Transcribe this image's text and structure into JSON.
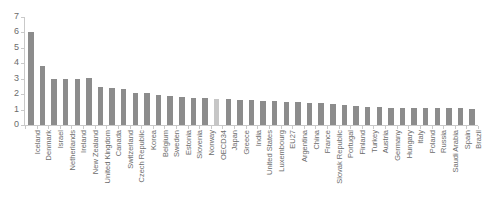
{
  "chart_data": {
    "type": "bar",
    "title": "",
    "subtitle": "",
    "xlabel": "",
    "ylabel": "",
    "ylim": [
      0,
      7
    ],
    "yticks": [
      0,
      1,
      2,
      3,
      4,
      5,
      6,
      7
    ],
    "ytick_labels": [
      "0",
      "1",
      "2",
      "3",
      "4",
      "5",
      "6",
      "7"
    ],
    "grid": false,
    "legend": "none",
    "orientation": "vertical",
    "bar_color": "#8c8c8c",
    "highlight_color": "#c6c6c6",
    "highlight_category": "OECD34",
    "axis_color": "#c9c9c9",
    "label_color": "#6b6b6b",
    "categories": [
      "Iceland",
      "Denmark",
      "Israel",
      "Netherlands",
      "Ireland",
      "New Zealand",
      "United Kingdom",
      "Canada",
      "Switzerland",
      "Czech Republic",
      "Korea",
      "Belgium",
      "Sweden",
      "Estonia",
      "Slovenia",
      "Norway",
      "OECD34",
      "Japan",
      "Greece",
      "India",
      "United States",
      "Luxembourg",
      "EU27",
      "Argentina",
      "China",
      "France",
      "Slovak Republic",
      "Portugal",
      "Finland",
      "Turkey",
      "Austria",
      "Germany",
      "Hungary",
      "Italy",
      "Poland",
      "Russia",
      "Saudi Arabia",
      "Spain",
      "Brazil"
    ],
    "values": [
      6.0,
      3.8,
      3.0,
      3.0,
      3.0,
      3.05,
      2.45,
      2.4,
      2.35,
      2.1,
      2.05,
      1.95,
      1.9,
      1.8,
      1.75,
      1.72,
      1.7,
      1.68,
      1.65,
      1.6,
      1.55,
      1.53,
      1.5,
      1.47,
      1.42,
      1.4,
      1.38,
      1.3,
      1.25,
      1.2,
      1.15,
      1.12,
      1.12,
      1.12,
      1.12,
      1.12,
      1.12,
      1.12,
      1.05
    ]
  }
}
